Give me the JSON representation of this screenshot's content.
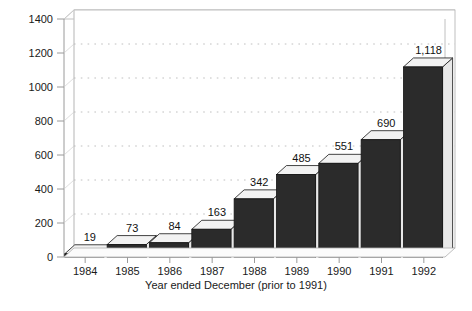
{
  "chart_data": {
    "type": "bar",
    "title": "",
    "xlabel": "Year ended December (prior to 1991)",
    "ylabel": "",
    "categories": [
      "1984",
      "1985",
      "1986",
      "1987",
      "1988",
      "1989",
      "1990",
      "1991",
      "1992"
    ],
    "values": [
      19,
      73,
      84,
      163,
      342,
      485,
      551,
      690,
      1118
    ],
    "value_labels": [
      "19",
      "73",
      "84",
      "163",
      "342",
      "485",
      "551",
      "690",
      "1,118"
    ],
    "ylim": [
      0,
      1400
    ],
    "ytick_labels": [
      "0",
      "200",
      "400",
      "600",
      "800",
      "1000",
      "1200",
      "1400"
    ],
    "ytick_values": [
      0,
      200,
      400,
      600,
      800,
      1000,
      1200,
      1400
    ],
    "grid": "horizontal-dotted",
    "legend": "none",
    "style": "3d-bars",
    "colors": {
      "bar_face": "#2b2b2b",
      "bar_top": "#f2f2f2",
      "bar_side": "#e8e8e8",
      "bar_outline": "#151515",
      "grid": "#b9b9b9",
      "axis": "#9a9a9a",
      "frame": "#b0b0b0",
      "text": "#1a1a1a",
      "background": "#ffffff"
    }
  }
}
